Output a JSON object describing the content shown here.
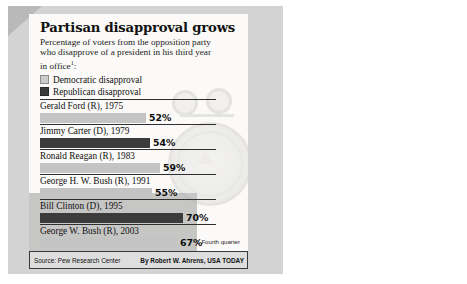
{
  "chart_data": {
    "type": "bar",
    "title": "Partisan disapproval grows",
    "subtitle_line1": "Percentage of voters from the opposition",
    "subtitle_line2": "party who disapprove of a president in his",
    "subtitle_line3": "third year in office",
    "subtitle_sup": "1",
    "subtitle_colon": ":",
    "xlabel": "",
    "ylabel": "",
    "xlim": [
      0,
      100
    ],
    "grid": false,
    "legend_position": "top-left",
    "legend": [
      {
        "key": "dem",
        "label": "Democratic disapproval",
        "color": "#c4c4c4"
      },
      {
        "key": "rep",
        "label": "Republican disapproval",
        "color": "#3b3b3b"
      }
    ],
    "categories": [
      "Gerald Ford (R), 1975",
      "Jimmy Carter (D), 1979",
      "Ronald Reagan (R), 1983",
      "George H. W. Bush (R), 1991",
      "Bill Clinton (D), 1995",
      "George W. Bush (R), 2003"
    ],
    "values": [
      52,
      54,
      59,
      55,
      70,
      67
    ],
    "value_labels": [
      "52%",
      "54%",
      "59%",
      "55%",
      "70%",
      "67%"
    ],
    "series_key": [
      "dem",
      "rep",
      "dem",
      "dem",
      "rep",
      "dem"
    ],
    "bars": [
      {
        "name": "Gerald Ford (R), 1975",
        "value": 52,
        "label": "52%",
        "party_series": "dem"
      },
      {
        "name": "Jimmy Carter (D), 1979",
        "value": 54,
        "label": "54%",
        "party_series": "rep"
      },
      {
        "name": "Ronald Reagan (R), 1983",
        "value": 59,
        "label": "59%",
        "party_series": "dem"
      },
      {
        "name": "George H. W. Bush (R), 1991",
        "value": 55,
        "label": "55%",
        "party_series": "dem"
      },
      {
        "name": "Bill Clinton (D), 1995",
        "value": 70,
        "label": "70%",
        "party_series": "rep"
      },
      {
        "name": "George W. Bush (R), 2003",
        "value": 67,
        "label": "67%",
        "party_series": "dem"
      }
    ],
    "annotations": [
      {
        "mark": "1",
        "text": "Fourth quarter"
      }
    ]
  },
  "footer": {
    "source": "Source: Pew Research Center",
    "byline": "By Robert W. Ahrens, USA TODAY"
  },
  "colors": {
    "democratic": "#c4c4c4",
    "republican": "#3b3b3b",
    "frame": "#3a3a3a",
    "panel": "#fbfaf8",
    "page": "#d3d3d3",
    "source_strip": "#dedede"
  }
}
